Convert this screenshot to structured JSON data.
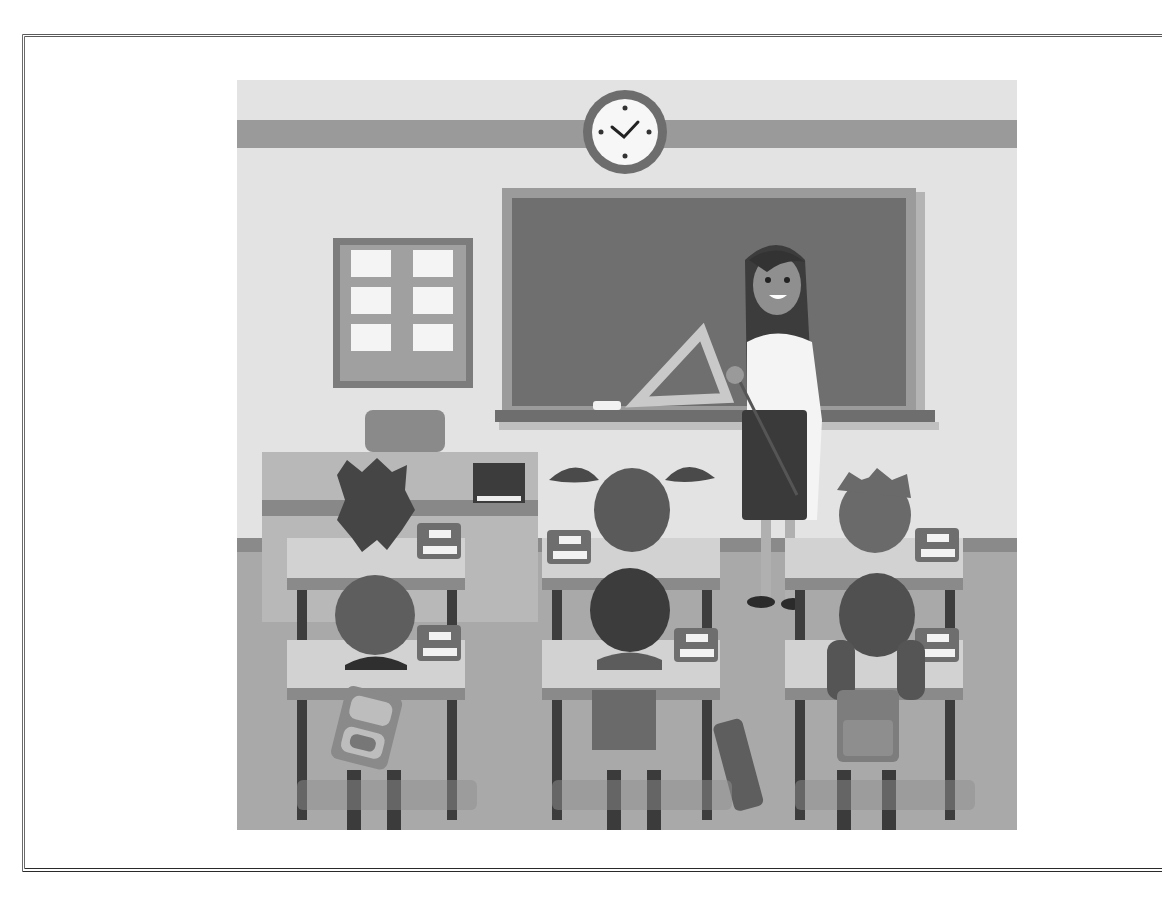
{
  "figure": {
    "scene": {
      "elements": [
        "wall-clock",
        "chalkboard",
        "bulletin-board",
        "teacher",
        "teacher-desk",
        "student-desks",
        "students",
        "backpacks"
      ],
      "student_count": 6,
      "desk_rows": 2,
      "desk_columns": 3,
      "clock_time": "about 10:10"
    },
    "palette": {
      "wall": "#e2e2e2",
      "wall_stripe": "#9a9a9a",
      "floor": "#a8a8a8",
      "board": "#6f6f6f",
      "board_frame": "#9b9b9b",
      "desk_top": "#d0d0d0",
      "dark": "#4a4a4a",
      "white": "#f7f7f7"
    }
  }
}
